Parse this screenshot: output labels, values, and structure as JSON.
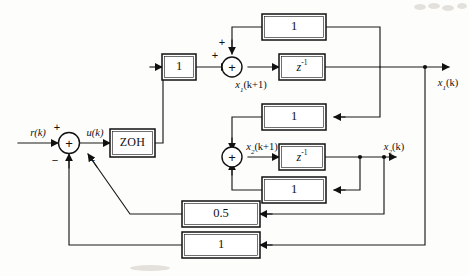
{
  "figure": {
    "background_color": "#fdfdfb",
    "line_color": "#1a1a1a"
  },
  "signals": {
    "reference_input": "r(k)",
    "control_input": "u(k)",
    "state1_next": "x",
    "state1_next_sub": "1",
    "state1_next_arg": "(k+1)",
    "state1_out": "x",
    "state1_out_sub": "1",
    "state1_out_arg": "(k)",
    "state2_next": "x",
    "state2_next_sub": "2",
    "state2_next_arg": "(k+1)",
    "state2_out": "x",
    "state2_out_sub": "2",
    "state2_out_arg": "(k)"
  },
  "blocks": {
    "zoh": {
      "label": "ZOH",
      "name": "zero-order-hold"
    },
    "input_gain": {
      "label": "1",
      "name": "input-gain"
    },
    "upper_feedforward_gain": {
      "label": "1",
      "name": "upper-feedforward-gain"
    },
    "upper_delay": {
      "label": "z",
      "exponent": "-1",
      "name": "upper-unit-delay"
    },
    "upper_feedback_gain": {
      "label": "1",
      "name": "upper-feedback-gain"
    },
    "cross_coupling_gain": {
      "label": "1",
      "name": "cross-coupling-gain"
    },
    "lower_delay": {
      "label": "z",
      "exponent": "-1",
      "name": "lower-unit-delay"
    },
    "lower_feedback_gain": {
      "label": "1",
      "name": "lower-feedback-gain"
    },
    "outer_gain_half": {
      "label": "0.5",
      "name": "outer-feedback-gain-half"
    },
    "outer_gain_one": {
      "label": "1",
      "name": "outer-feedback-gain-one"
    }
  },
  "summing_junctions": {
    "input_summer": {
      "symbol": "+",
      "signs": [
        "+",
        "−",
        "−"
      ],
      "name": "input-summing-junction"
    },
    "state1_summer": {
      "symbol": "+",
      "signs": [
        "+",
        "+"
      ],
      "name": "state1-summing-junction"
    },
    "state2_summer": {
      "symbol": "+",
      "signs": [],
      "name": "state2-summing-junction"
    }
  },
  "signs": {
    "plus": "+",
    "minus": "−"
  }
}
